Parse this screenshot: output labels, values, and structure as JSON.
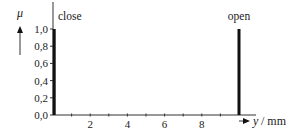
{
  "chart_data": {
    "type": "bar",
    "title": "",
    "xlabel": "y / mm",
    "xlabel_var": "y",
    "xlabel_unit": "/ mm",
    "ylabel": "μ",
    "x": [
      0,
      10
    ],
    "values": [
      1.0,
      1.0
    ],
    "annotations": [
      {
        "text": "close",
        "x": 0,
        "y": 1.0
      },
      {
        "text": "open",
        "x": 10,
        "y": 1.0
      }
    ],
    "xlim": [
      0,
      10.9
    ],
    "ylim": [
      0.0,
      1.0
    ],
    "x_ticks_major": [
      2,
      4,
      6,
      8
    ],
    "x_ticks_minor": [
      1,
      2,
      3,
      4,
      5,
      6,
      7,
      8,
      9
    ],
    "x_tick_labels": [
      "2",
      "4",
      "6",
      "8"
    ],
    "y_ticks": [
      0.0,
      0.2,
      0.4,
      0.6,
      0.8,
      1.0
    ],
    "y_tick_labels": [
      "0,0",
      "0,2",
      "0,4",
      "0,6",
      "0,8",
      "1,0"
    ],
    "grid": false,
    "legend": "none",
    "bar_color": "#111111",
    "axis_color": "#333333"
  }
}
